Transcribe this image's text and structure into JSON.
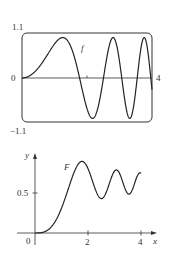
{
  "chart_data": [
    {
      "type": "line",
      "name": "f",
      "function": "sin(x^2)",
      "series_label": "f",
      "xlim": [
        0,
        4
      ],
      "ylim": [
        -1.1,
        1.1
      ],
      "tick_labels": {
        "x_left": "0",
        "x_right": "4",
        "y_top": "1.1",
        "y_bottom": "-1.1",
        "y_bottom_display": "−1.1"
      },
      "x_ticks": [
        2
      ],
      "frame": "rounded-box",
      "grid": false,
      "key_points": [
        {
          "x": 0,
          "y": 0
        },
        {
          "x": 1.2533,
          "y": 1
        },
        {
          "x": 1.7725,
          "y": 0
        },
        {
          "x": 2.1708,
          "y": -1
        },
        {
          "x": 2.5066,
          "y": 0
        },
        {
          "x": 2.8025,
          "y": 1
        },
        {
          "x": 3.07,
          "y": 0
        },
        {
          "x": 3.316,
          "y": -1
        },
        {
          "x": 3.5449,
          "y": 0
        },
        {
          "x": 3.7599,
          "y": 1
        },
        {
          "x": 3.9633,
          "y": 0
        },
        {
          "x": 4,
          "y": -0.288
        }
      ]
    },
    {
      "type": "line",
      "name": "F",
      "function": "integral from 0 to x of sin(t^2) dt",
      "series_label": "F",
      "xlim": [
        0,
        4
      ],
      "ylim": [
        0,
        1
      ],
      "xlabel": "x",
      "ylabel": "y",
      "tick_labels": {
        "origin": "0",
        "x": [
          "2",
          "4"
        ],
        "y": [
          "0.5"
        ]
      },
      "x_ticks": [
        2,
        4
      ],
      "y_ticks": [
        0.5
      ],
      "grid": false,
      "key_points": [
        {
          "x": 0,
          "y": 0
        },
        {
          "x": 1.0,
          "y": 0.31
        },
        {
          "x": 1.7725,
          "y": 0.895
        },
        {
          "x": 2.5066,
          "y": 0.462
        },
        {
          "x": 3.07,
          "y": 0.779
        },
        {
          "x": 3.5449,
          "y": 0.497
        },
        {
          "x": 3.9633,
          "y": 0.741
        },
        {
          "x": 4,
          "y": 0.747
        }
      ]
    }
  ],
  "layout": {
    "top": {
      "x0": 22,
      "x1": 152,
      "y_top": 33,
      "y_bottom": 122,
      "y_zero": 78
    },
    "bottom": {
      "x0": 35,
      "px_per_x": 26.5,
      "y_zero": 233,
      "px_per_y": 80,
      "x_end": 157,
      "y_end": 153
    }
  }
}
